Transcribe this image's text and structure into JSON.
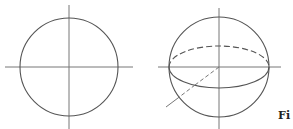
{
  "figure": {
    "caption": "Fi",
    "stroke_color": "#555555",
    "axis_color": "#777777"
  },
  "panels": [
    {
      "name": "circle-panel",
      "shape": "circle with crossed axes",
      "center": [
        69,
        67
      ],
      "radius": 49
    },
    {
      "name": "sphere-panel",
      "shape": "sphere with equator ellipse and oblique axis",
      "center": [
        219,
        67
      ],
      "radius": 50,
      "equator": {
        "rx": 50,
        "ry": 21,
        "back_half": "dashed",
        "front_half": "solid"
      }
    }
  ]
}
